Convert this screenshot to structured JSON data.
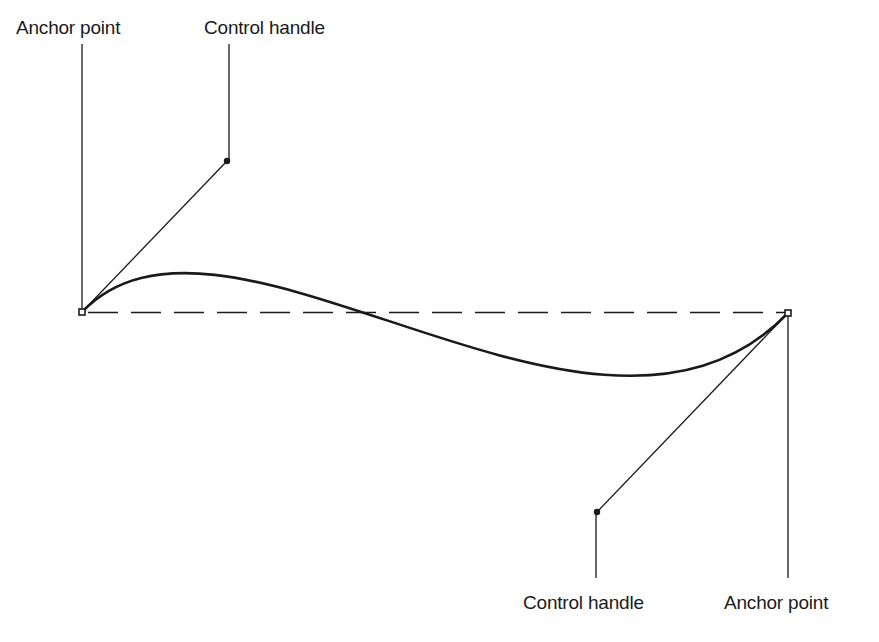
{
  "diagram": {
    "type": "cubic-bezier-curve",
    "labels": {
      "top_left_anchor": "Anchor point",
      "top_control_handle": "Control handle",
      "bottom_control_handle": "Control handle",
      "bottom_right_anchor": "Anchor point"
    },
    "points": {
      "anchor_start": [
        82,
        312
      ],
      "control_1": [
        227,
        161
      ],
      "control_2": [
        597,
        512
      ],
      "anchor_end": [
        788,
        313
      ]
    },
    "colors": {
      "stroke": "#1a1a1a",
      "background": "#ffffff"
    }
  }
}
